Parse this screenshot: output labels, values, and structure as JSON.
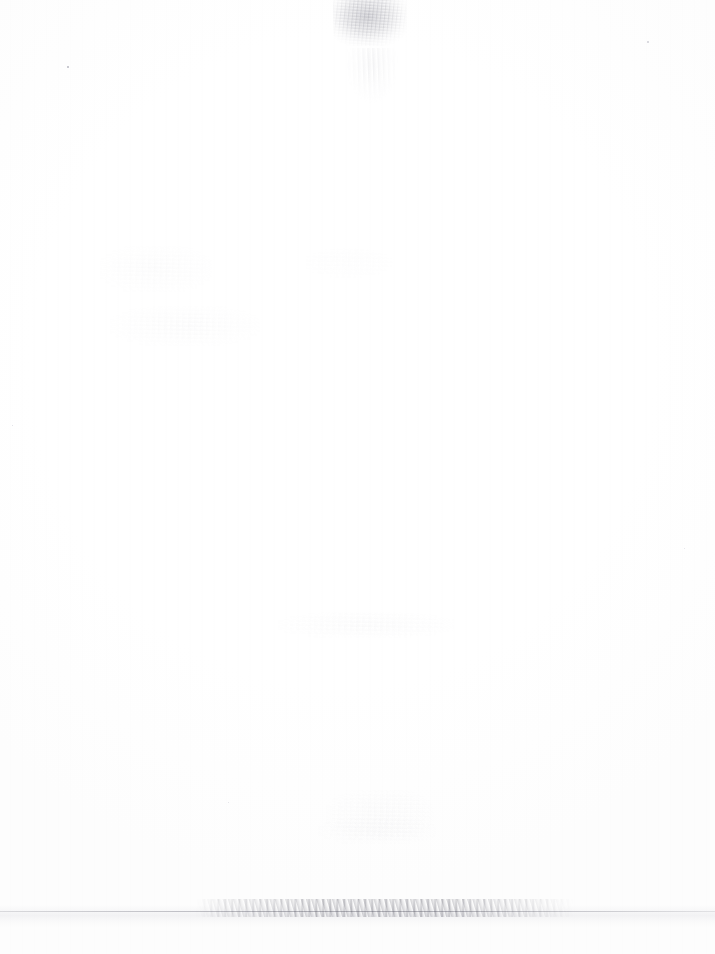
{
  "page": {
    "kind": "scanned-document-page",
    "content_state": "blank",
    "width_px": 715,
    "height_px": 954,
    "paper_color": "#ffffff",
    "text_content": "",
    "visible_text": []
  },
  "artifacts": {
    "smudge_top": {
      "name": "top-center show-through smudge",
      "x": 333,
      "y": 0,
      "width": 74,
      "height": 46,
      "color": "#8a8a95",
      "opacity": 0.3
    },
    "smudge_top_tail": {
      "name": "faint stroke tails below top smudge",
      "x": 344,
      "y": 48,
      "width": 56,
      "height": 70,
      "color": "#9a9aa6",
      "opacity": 0.14
    },
    "ghost_blocks": [
      {
        "name": "upper-left bleed-through block",
        "x": 100,
        "y": 246,
        "width": 112,
        "height": 46,
        "opacity": 0.5
      },
      {
        "name": "mid-left bleed-through block",
        "x": 110,
        "y": 306,
        "width": 150,
        "height": 40,
        "opacity": 0.55
      },
      {
        "name": "right-of-center faint block",
        "x": 300,
        "y": 248,
        "width": 96,
        "height": 30,
        "opacity": 0.3
      },
      {
        "name": "center faint line block",
        "x": 278,
        "y": 612,
        "width": 176,
        "height": 26,
        "opacity": 0.6
      },
      {
        "name": "lower-center handwriting ghost",
        "x": 326,
        "y": 790,
        "width": 108,
        "height": 50,
        "opacity": 0.62
      },
      {
        "name": "lower-center second line ghost",
        "x": 318,
        "y": 818,
        "width": 118,
        "height": 26,
        "opacity": 0.5
      }
    ],
    "fold_line": {
      "name": "horizontal fold / edge line",
      "y": 911,
      "x": 0,
      "width": 715,
      "height": 1,
      "color": "#7d7d88"
    },
    "fold_speckle": {
      "name": "speckled dirt along fold",
      "x": 196,
      "y": 899,
      "width": 378,
      "height": 18,
      "color": "#5a5a66"
    },
    "fold_shadow": {
      "name": "soft shadow band under fold",
      "x": 0,
      "y": 905,
      "width": 715,
      "height": 22,
      "color": "#babac6"
    },
    "specks": [
      {
        "name": "upper-left speck",
        "x": 67,
        "y": 66,
        "size": 2,
        "color": "#b9b9c2"
      },
      {
        "name": "upper-right speck",
        "x": 647,
        "y": 41,
        "size": 2,
        "color": "#cfcfd6"
      },
      {
        "name": "left-margin speck",
        "x": 12,
        "y": 425,
        "size": 1,
        "color": "#dcdce2"
      },
      {
        "name": "right-margin speck",
        "x": 684,
        "y": 548,
        "size": 1,
        "color": "#e0e0e6"
      },
      {
        "name": "lower-left speck",
        "x": 228,
        "y": 802,
        "size": 1,
        "color": "#dedee4"
      }
    ]
  }
}
